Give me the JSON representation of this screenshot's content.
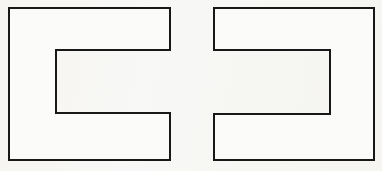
{
  "figure": {
    "background_color": "#f7f7f5",
    "stroke_color": "#181818",
    "fill_color": "#fbfbfa",
    "stroke_width": 2,
    "canvas": {
      "width": 382,
      "height": 171
    },
    "shapes": [
      {
        "id": "left-e-shape",
        "name": "E-shape-normal",
        "description": "E shape with spine on the left and two arms extending right",
        "orientation": "left-spine",
        "bounds": {
          "x": 9,
          "y": 8,
          "width": 161,
          "height": 152
        },
        "spine": {
          "x": 9,
          "y": 8,
          "width": 47,
          "height": 152
        },
        "arms": [
          {
            "name": "upper-arm",
            "x": 56,
            "y": 8,
            "width": 114,
            "height": 42
          },
          {
            "name": "lower-arm",
            "x": 56,
            "y": 113,
            "width": 114,
            "height": 47
          }
        ],
        "points": "9,8 170,8 170,50 56,50 56,113 170,113 170,160 9,160"
      },
      {
        "id": "right-e-shape",
        "name": "E-shape-mirrored",
        "description": "Mirrored E shape with spine on the right and two arms extending left",
        "orientation": "right-spine",
        "bounds": {
          "x": 214,
          "y": 8,
          "width": 160,
          "height": 152
        },
        "spine": {
          "x": 330,
          "y": 8,
          "width": 44,
          "height": 152
        },
        "arms": [
          {
            "name": "upper-arm",
            "x": 214,
            "y": 8,
            "width": 116,
            "height": 42
          },
          {
            "name": "lower-arm",
            "x": 214,
            "y": 114,
            "width": 116,
            "height": 46
          }
        ],
        "points": "374,8 214,8 214,50 330,50 330,114 214,114 214,160 374,160"
      }
    ]
  }
}
